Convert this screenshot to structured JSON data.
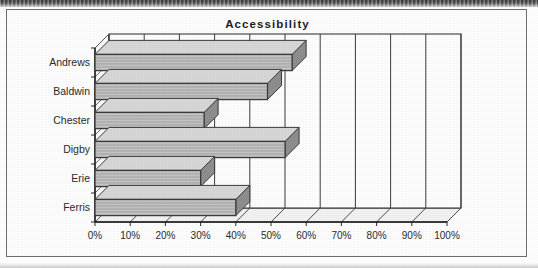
{
  "chart_data": {
    "type": "bar",
    "orientation": "horizontal",
    "title": "Accessibility",
    "xlabel": "",
    "ylabel": "",
    "categories": [
      "Andrews",
      "Baldwin",
      "Chester",
      "Digby",
      "Erie",
      "Ferris"
    ],
    "values": [
      56,
      49,
      31,
      54,
      30,
      40
    ],
    "value_suffix": "%",
    "xlim": [
      0,
      100
    ],
    "xticks": [
      0,
      10,
      20,
      30,
      40,
      50,
      60,
      70,
      80,
      90,
      100
    ],
    "xtick_labels": [
      "0%",
      "10%",
      "20%",
      "30%",
      "40%",
      "50%",
      "60%",
      "70%",
      "80%",
      "90%",
      "100%"
    ],
    "grid": true,
    "grid_axis": "x",
    "legend": null,
    "style": "3d-bar",
    "bar_color": "#b2b2b2",
    "bar_edge_color": "#3a3a3a",
    "plot_background": "#fdfdfd",
    "axis_color": "#2a2a2a"
  },
  "appearance": {
    "frame_border_color": "#6f6f6f",
    "page_background": "#ffffff",
    "text_color": "#2b2b2b"
  }
}
